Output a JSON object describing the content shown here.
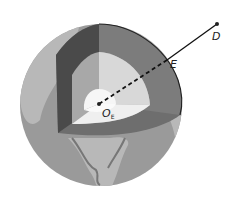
{
  "diagram": {
    "labels": {
      "D": "D",
      "E": "E",
      "center": "O",
      "center_sub": "E"
    },
    "colors": {
      "ocean": "#9a9a9a",
      "land": "#b8b8b8",
      "crust_dark": "#4a4a4a",
      "mantle": "#7a7a7a",
      "outer_core_light": "#d8d8d8",
      "outer_core_mid": "#a8a8a8",
      "inner_core": "#f4f4f4",
      "line": "#111111"
    }
  }
}
